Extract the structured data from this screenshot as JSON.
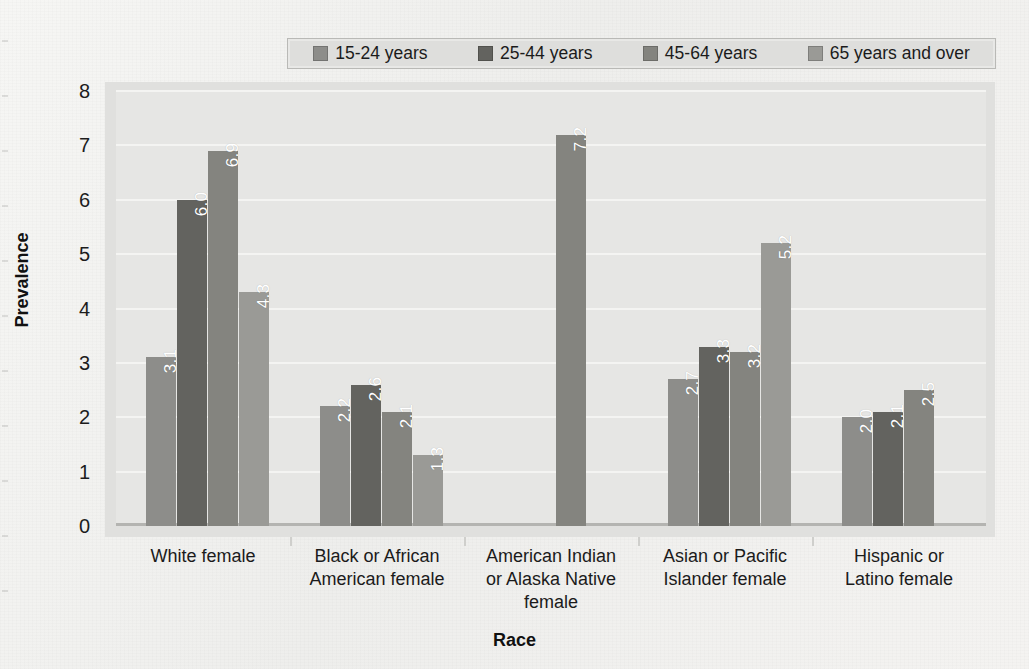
{
  "chart_data": {
    "type": "bar",
    "title": "",
    "xlabel": "Race",
    "ylabel": "Prevalence",
    "ylim": [
      0,
      8
    ],
    "yticks": [
      "0",
      "1",
      "2",
      "3",
      "4",
      "5",
      "6",
      "7",
      "8"
    ],
    "grid": true,
    "legend_position": "top",
    "categories": [
      "White female",
      "Black or African American female",
      "American Indian or Alaska Native female",
      "Asian or Pacific Islander female",
      "Hispanic or Latino female"
    ],
    "category_lines": [
      [
        "White female"
      ],
      [
        "Black or African",
        "American female"
      ],
      [
        "American Indian",
        "or Alaska Native",
        "female"
      ],
      [
        "Asian or Pacific",
        "Islander female"
      ],
      [
        "Hispanic or",
        "Latino female"
      ]
    ],
    "series": [
      {
        "name": "15-24 years",
        "color": "#8d8d8a",
        "values": [
          3.1,
          2.2,
          null,
          2.7,
          2.0
        ]
      },
      {
        "name": "25-44 years",
        "color": "#63635f",
        "values": [
          6.0,
          2.6,
          null,
          3.3,
          2.1
        ]
      },
      {
        "name": "45-64 years",
        "color": "#84847f",
        "values": [
          6.9,
          2.1,
          7.2,
          3.2,
          2.5
        ]
      },
      {
        "name": "65 years and over",
        "color": "#9a9a96",
        "values": [
          4.3,
          1.3,
          null,
          5.2,
          null
        ]
      }
    ],
    "value_labels": [
      [
        "3.1",
        "6.0",
        "6.9",
        "4.3"
      ],
      [
        "2.2",
        "2.6",
        "2.1",
        "1.3"
      ],
      [
        "",
        "",
        "7.2",
        ""
      ],
      [
        "2.7",
        "3.3",
        "3.2",
        "5.2"
      ],
      [
        "2.0",
        "2.1",
        "2.5",
        ""
      ]
    ]
  },
  "legend": {
    "items": [
      {
        "label": "15-24 years"
      },
      {
        "label": "25-44 years"
      },
      {
        "label": "45-64 years"
      },
      {
        "label": "65 years and over"
      }
    ]
  }
}
